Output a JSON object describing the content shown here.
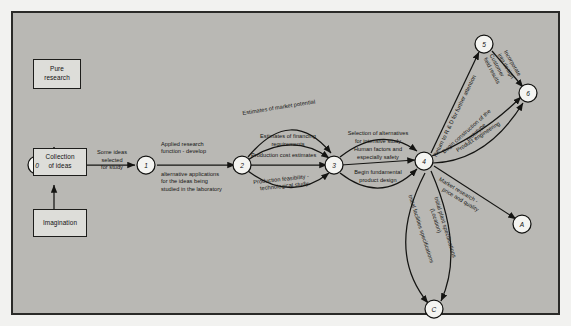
{
  "diagram": {
    "colors": {
      "page": "#b9b8b4",
      "frame": "#2a2a28",
      "box_fill": "#ddddd9",
      "ink": "#141412"
    },
    "boxes": [
      {
        "id": "pure-research",
        "label": "Pure\nresearch"
      },
      {
        "id": "collection-of-ideas",
        "label": "Collection\nof  ideas"
      },
      {
        "id": "imagination",
        "label": "Imagination"
      }
    ],
    "nodes": [
      {
        "id": "n0",
        "label": "0"
      },
      {
        "id": "n1",
        "label": "1"
      },
      {
        "id": "n2",
        "label": "2"
      },
      {
        "id": "n3",
        "label": "3"
      },
      {
        "id": "n4",
        "label": "4"
      },
      {
        "id": "n5",
        "label": "5"
      },
      {
        "id": "n6",
        "label": "6"
      },
      {
        "id": "nA",
        "label": "A"
      },
      {
        "id": "nC",
        "label": "C"
      }
    ],
    "edge_labels": {
      "e0_1_a": "Some ideas",
      "e0_1_b": "selected",
      "e0_1_c": "for study",
      "e1_2_a": "Applied research",
      "e1_2_b": "function - develop",
      "e1_2_c": "alternative  applications",
      "e1_2_d": "for the ideas being",
      "e1_2_e": "studied in the laboratory",
      "e2_3_arc1": "Estimates of market potential",
      "e2_3_arc2_a": "Estimates of financing",
      "e2_3_arc2_b": "requirements",
      "e2_3_arc3": "Production cost estimates",
      "e2_3_arc4_a": "Production feasibility -",
      "e2_3_arc4_b": "technological study",
      "e3_4_arc1_a": "Selection of alternatives",
      "e3_4_arc1_b": "for intensive study",
      "e3_4_arc2_a": "Human factors and",
      "e3_4_arc2_b": "especially safety",
      "e3_4_arc3_a": "Begin fundamental",
      "e3_4_arc3_b": "product design",
      "e4_5": "Return to R & D for further attention",
      "e4_6_a": "Begin construction of the",
      "e4_6_b": "prototype",
      "e4_6_c": "Product engineering",
      "e5_6_a": "Incorporate",
      "e5_6_b": "into design",
      "e5_6_c": "Customer",
      "e5_6_d": "field results",
      "e4_A_a": "Market research -",
      "e4_A_b": "price and quality",
      "e4_C_arc1_a": "Initial plant specifications",
      "e4_C_arc1_b": "(Location)",
      "e4_C_arc2": "Initial facilities specifications"
    }
  }
}
